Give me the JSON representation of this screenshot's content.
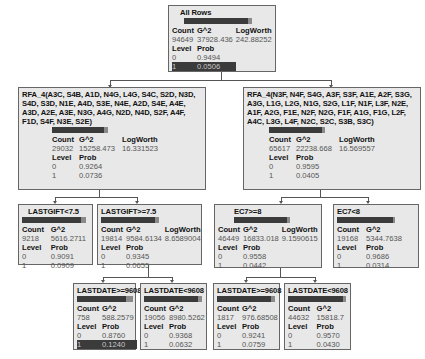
{
  "tree": {
    "root": {
      "split": "All Rows",
      "count": "94649",
      "g2": "37928.436",
      "logworth": "242.88252",
      "levels": [
        {
          "level": "0",
          "prob": "0.9494"
        },
        {
          "level": "1",
          "prob": "0.0506"
        }
      ],
      "highlight_level": "1"
    },
    "left": {
      "split": "RFA_4(A3C, S4B, A1D, N4G, L4G, S4C, S2D, N3D, S4D, S3D, N1E, A4D, S3E, N4E, A2D, S4E, A4E, A3D, A2E, A3E, N3G, A4G, N2D, N4D, S2F, A4F, F1D, S4F, N3E, S2E)",
      "count": "29032",
      "g2": "15258.473",
      "logworth": "16.331523",
      "levels": [
        {
          "level": "0",
          "prob": "0.9264"
        },
        {
          "level": "1",
          "prob": "0.0736"
        }
      ]
    },
    "right": {
      "split": "RFA_4(N3F, N4F, S4G, A3F, S3F, A1E, A2F, S3G, A3G, L1G, L2G, N1G, S2G, L1F, N1F, L3F, N2E, A1F, A2G, F1E, N2F, N2G, F1F, A1G, F1G, L2F, A4C, L3G, L4F, N2C, S2C, S3B, S3C)",
      "count": "65617",
      "g2": "22238.668",
      "logworth": "16.569557",
      "levels": [
        {
          "level": "0",
          "prob": "0.9595"
        },
        {
          "level": "1",
          "prob": "0.0405"
        }
      ]
    },
    "left_left": {
      "split": "LASTGIFT<7.5",
      "count": "9218",
      "g2": "5616.2711",
      "levels": [
        {
          "level": "0",
          "prob": "0.9091"
        },
        {
          "level": "1",
          "prob": "0.0909"
        }
      ]
    },
    "left_right": {
      "split": "LASTGIFT>=7.5",
      "count": "19814",
      "g2": "9584.6134",
      "logworth": "8.6589004",
      "levels": [
        {
          "level": "0",
          "prob": "0.9345"
        },
        {
          "level": "1",
          "prob": "0.0655"
        }
      ]
    },
    "right_left": {
      "split": "EC7>=8",
      "count": "46449",
      "g2": "16833.018",
      "logworth": "9.1590615",
      "levels": [
        {
          "level": "0",
          "prob": "0.9558"
        },
        {
          "level": "1",
          "prob": "0.0442"
        }
      ]
    },
    "right_right": {
      "split": "EC7<8",
      "count": "19168",
      "g2": "5344.7638",
      "levels": [
        {
          "level": "0",
          "prob": "0.9686"
        },
        {
          "level": "1",
          "prob": "0.0314"
        }
      ]
    },
    "lr_left": {
      "split": "LASTDATE>=9608",
      "count": "758",
      "g2": "588.2579",
      "levels": [
        {
          "level": "0",
          "prob": "0.8760"
        },
        {
          "level": "1",
          "prob": "0.1240"
        }
      ],
      "highlight_level": "1"
    },
    "lr_right": {
      "split": "LASTDATE<9608",
      "count": "19056",
      "g2": "8980.5262",
      "levels": [
        {
          "level": "0",
          "prob": "0.9368"
        },
        {
          "level": "1",
          "prob": "0.0632"
        }
      ]
    },
    "rl_left": {
      "split": "LASTDATE>=9608",
      "count": "1817",
      "g2": "976.68508",
      "levels": [
        {
          "level": "0",
          "prob": "0.9241"
        },
        {
          "level": "1",
          "prob": "0.0759"
        }
      ]
    },
    "rl_right": {
      "split": "LASTDATE<9608",
      "count": "44632",
      "g2": "15818.7",
      "levels": [
        {
          "level": "0",
          "prob": "0.9570"
        },
        {
          "level": "1",
          "prob": "0.0430"
        }
      ]
    }
  },
  "labels": {
    "count": "Count",
    "g2": "G^2",
    "logworth": "LogWorth",
    "level": "Level",
    "prob": "Prob"
  },
  "colors": {
    "node_bg": "#e8e8e8",
    "bar_dark": "#3b3b3b",
    "bar_light": "#8a8a8a",
    "border": "#666666"
  }
}
